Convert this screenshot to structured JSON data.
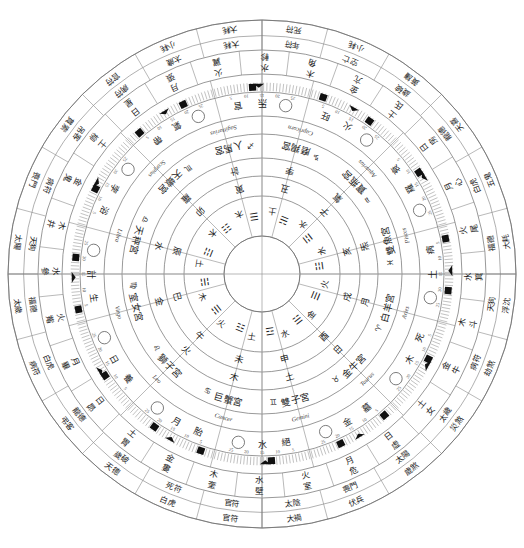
{
  "meta": {
    "type": "astrological-wheel",
    "center_x": 262,
    "center_y": 274,
    "outer_radius": 254,
    "inner_hub_radius": 38,
    "background": "#ffffff",
    "ink": "#1d1d1d"
  },
  "chart_data": {
    "type": "pie",
    "subtitle": "Twelve-palace zodiac wheel with Chinese branches, trigrams and lunar mansions",
    "legend_position": "none",
    "grid": false,
    "categories": [
      "Aries",
      "Taurus",
      "Gemini",
      "Cancer",
      "Leo",
      "Virgo",
      "Libra",
      "Scorpius",
      "Sagittarius",
      "Capricorn",
      "Aquarius",
      "Pisces"
    ],
    "values": [
      30,
      30,
      30,
      30,
      30,
      30,
      30,
      30,
      30,
      30,
      30,
      30
    ],
    "xlabel": "ecliptic longitude (degrees)",
    "ylabel": "",
    "ylim": [
      0,
      360
    ],
    "axis_range_degrees": [
      0,
      360
    ],
    "sector_span_degrees": 30,
    "annotations": [
      "degree scale ticked every 1°, labelled every 5°",
      "four quadrant axes at 0°, 90°, 180°, 270°"
    ]
  },
  "rings": [
    {
      "id": "ring-hub",
      "name": "empty-center-hub",
      "r_outer": 38,
      "r_inner": 0,
      "content": "blank"
    },
    {
      "id": "ring-trigram",
      "name": "trigram-branch-ring",
      "r_outer": 78,
      "r_inner": 38,
      "cells": 12
    },
    {
      "id": "ring-branch",
      "name": "earthly-branch-ring",
      "r_outer": 98,
      "r_inner": 78,
      "cells": 12
    },
    {
      "id": "ring-luminary",
      "name": "luminary-element-ring",
      "r_outer": 116,
      "r_inner": 98,
      "cells": 12
    },
    {
      "id": "ring-palace",
      "name": "zodiac-palace-ring",
      "r_outer": 140,
      "r_inner": 116,
      "cells": 12
    },
    {
      "id": "ring-latin",
      "name": "latin-name-ring",
      "r_outer": 158,
      "r_inner": 140,
      "cells": 12
    },
    {
      "id": "ring-moon",
      "name": "moon-phase-ring",
      "r_outer": 182,
      "r_inner": 158,
      "cells": 24
    },
    {
      "id": "ring-degree",
      "name": "degree-scale-ring",
      "r_outer": 200,
      "r_inner": 182,
      "cells": 360
    },
    {
      "id": "ring-mansion",
      "name": "lunar-mansion-ring",
      "r_outer": 224,
      "r_inner": 200,
      "cells": 28
    },
    {
      "id": "ring-spirit",
      "name": "annual-spirit-ring",
      "r_outer": 254,
      "r_inner": 224,
      "cells": 24
    }
  ],
  "zodiac": [
    {
      "index": 0,
      "latin": "Aries",
      "chinese": "白羊宮",
      "sign_glyph": "♈",
      "start_deg": 0
    },
    {
      "index": 1,
      "latin": "Taurus",
      "chinese": "金牛宮",
      "sign_glyph": "♉",
      "start_deg": 30
    },
    {
      "index": 2,
      "latin": "Gemini",
      "chinese": "雙子宮",
      "sign_glyph": "♊",
      "start_deg": 60
    },
    {
      "index": 3,
      "latin": "Cancer",
      "chinese": "巨蟹宮",
      "sign_glyph": "♋",
      "start_deg": 90
    },
    {
      "index": 4,
      "latin": "Leo",
      "chinese": "獅子宮",
      "sign_glyph": "♌",
      "start_deg": 120
    },
    {
      "index": 5,
      "latin": "Virgo",
      "chinese": "室女宮",
      "sign_glyph": "♍",
      "start_deg": 150
    },
    {
      "index": 6,
      "latin": "Libra",
      "chinese": "天秤宮",
      "sign_glyph": "♎",
      "start_deg": 180
    },
    {
      "index": 7,
      "latin": "Scorpius",
      "chinese": "天蠍宮",
      "sign_glyph": "♏",
      "start_deg": 210
    },
    {
      "index": 8,
      "latin": "Sagittarius",
      "chinese": "人馬宮",
      "sign_glyph": "♐",
      "start_deg": 240
    },
    {
      "index": 9,
      "latin": "Capricorn",
      "chinese": "磨羯宮",
      "sign_glyph": "♑",
      "start_deg": 270
    },
    {
      "index": 10,
      "latin": "Aquarius",
      "chinese": "寶瓶宮",
      "sign_glyph": "♒",
      "start_deg": 300
    },
    {
      "index": 11,
      "latin": "Pisces",
      "chinese": "雙魚宮",
      "sign_glyph": "♓",
      "start_deg": 330
    }
  ],
  "branches": [
    {
      "branch": "戌",
      "element": "火",
      "trigram": "☰"
    },
    {
      "branch": "酉",
      "element": "金",
      "trigram": "☱"
    },
    {
      "branch": "申",
      "element": "水",
      "trigram": "☲"
    },
    {
      "branch": "未",
      "element": "土",
      "trigram": "☳"
    },
    {
      "branch": "午",
      "element": "火",
      "trigram": "☴"
    },
    {
      "branch": "巳",
      "element": "木",
      "trigram": "☵"
    },
    {
      "branch": "辰",
      "element": "土",
      "trigram": "☶"
    },
    {
      "branch": "卯",
      "element": "木",
      "trigram": "☷"
    },
    {
      "branch": "寅",
      "element": "木",
      "trigram": "☰"
    },
    {
      "branch": "丑",
      "element": "土",
      "trigram": "☱"
    },
    {
      "branch": "子",
      "element": "水",
      "trigram": "☲"
    },
    {
      "branch": "亥",
      "element": "水",
      "trigram": "☳"
    }
  ],
  "luminaries": [
    "月",
    "日",
    "土",
    "木",
    "火",
    "金",
    "水",
    "羅",
    "計",
    "孛",
    "氣",
    "炁"
  ],
  "palace_states": [
    "死",
    "墓",
    "絕",
    "胎",
    "養",
    "生",
    "浴",
    "帶",
    "官",
    "旺",
    "衰",
    "病"
  ],
  "degree_labels": [
    "5",
    "10",
    "15",
    "20",
    "25"
  ],
  "degree_major_labels": [
    "火",
    "羅",
    "土",
    "木",
    "金",
    "水",
    "月",
    "日",
    "計",
    "孛",
    "氣",
    "炁"
  ],
  "mansions": [
    {
      "name": "角",
      "element": "木"
    },
    {
      "name": "亢",
      "element": "金"
    },
    {
      "name": "氐",
      "element": "土"
    },
    {
      "name": "房",
      "element": "日"
    },
    {
      "name": "心",
      "element": "月"
    },
    {
      "name": "尾",
      "element": "火"
    },
    {
      "name": "箕",
      "element": "水"
    },
    {
      "name": "斗",
      "element": "木"
    },
    {
      "name": "牛",
      "element": "金"
    },
    {
      "name": "女",
      "element": "土"
    },
    {
      "name": "虛",
      "element": "日"
    },
    {
      "name": "危",
      "element": "月"
    },
    {
      "name": "室",
      "element": "火"
    },
    {
      "name": "壁",
      "element": "水"
    },
    {
      "name": "奎",
      "element": "木"
    },
    {
      "name": "婁",
      "element": "金"
    },
    {
      "name": "胃",
      "element": "土"
    },
    {
      "name": "昴",
      "element": "日"
    },
    {
      "name": "畢",
      "element": "月"
    },
    {
      "name": "觜",
      "element": "火"
    },
    {
      "name": "參",
      "element": "水"
    },
    {
      "name": "井",
      "element": "木"
    },
    {
      "name": "鬼",
      "element": "金"
    },
    {
      "name": "柳",
      "element": "土"
    },
    {
      "name": "星",
      "element": "日"
    },
    {
      "name": "張",
      "element": "月"
    },
    {
      "name": "翼",
      "element": "火"
    },
    {
      "name": "軫",
      "element": "水"
    }
  ],
  "spirits": [
    "死符",
    "小耗",
    "黃旛",
    "天喜",
    "五鬼",
    "大耗",
    "浮沈",
    "劫煞",
    "災煞",
    "歲煞",
    "伏兵",
    "大禍",
    "官符",
    "白虎",
    "天德",
    "弔客",
    "病符",
    "太歲",
    "太陽",
    "喪門",
    "貫索",
    "官符",
    "小耗",
    "大耗"
  ],
  "spirit_inner": [
    "年符",
    "空亡",
    "歲破",
    "龍德",
    "白虎",
    "福德",
    "天狗",
    "病符",
    "太歲",
    "太陽",
    "喪門",
    "太陰",
    "官符",
    "死符",
    "歲破",
    "龍德",
    "白虎",
    "福德",
    "天狗",
    "病符",
    "吊客",
    "病符",
    "太歲",
    "大耗"
  ],
  "quadrant_axis_labels": {
    "top": "南",
    "right": "東",
    "bottom": "北",
    "left": "西"
  }
}
